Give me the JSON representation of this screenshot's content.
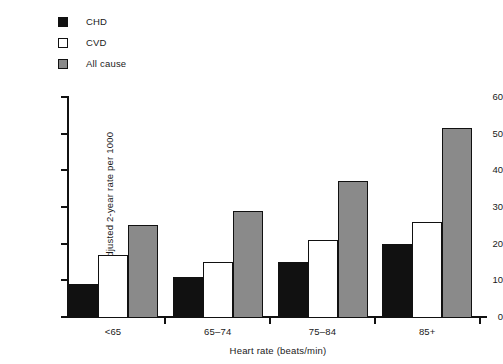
{
  "chart_data": {
    "type": "bar",
    "title": "",
    "xlabel": "Heart rate (beats/min)",
    "ylabel": "Age-adjusted 2-year rate per 1000",
    "categories": [
      "<65",
      "65–74",
      "75–84",
      "85+"
    ],
    "ylim": [
      0,
      60
    ],
    "yticks": [
      0,
      10,
      20,
      30,
      40,
      50,
      60
    ],
    "grid": false,
    "legend_position": "top-left",
    "series": [
      {
        "name": "CHD",
        "color": "#111111",
        "marker": "filled-square",
        "values": [
          9,
          11,
          15,
          20
        ]
      },
      {
        "name": "CVD",
        "color": "#ffffff",
        "marker": "open-square",
        "values": [
          17,
          15,
          21,
          26
        ]
      },
      {
        "name": "All cause",
        "color": "#8a8a8a",
        "marker": "grey-square",
        "values": [
          25,
          29,
          37,
          51.5
        ]
      }
    ]
  },
  "legend": {
    "items": [
      {
        "label": "CHD"
      },
      {
        "label": "CVD"
      },
      {
        "label": "All cause"
      }
    ]
  },
  "axes": {
    "y_title": "Age-adjusted 2-year rate per 1000",
    "x_title": "Heart rate (beats/min)",
    "y_tick_labels": [
      "0",
      "10",
      "20",
      "30",
      "40",
      "50",
      "60"
    ],
    "x_tick_labels": [
      "<65",
      "65–74",
      "75–84",
      "85+"
    ]
  },
  "colors": {
    "chd": "#111111",
    "cvd": "#ffffff",
    "all_cause": "#8a8a8a",
    "axis": "#111111",
    "background": "#ffffff"
  }
}
